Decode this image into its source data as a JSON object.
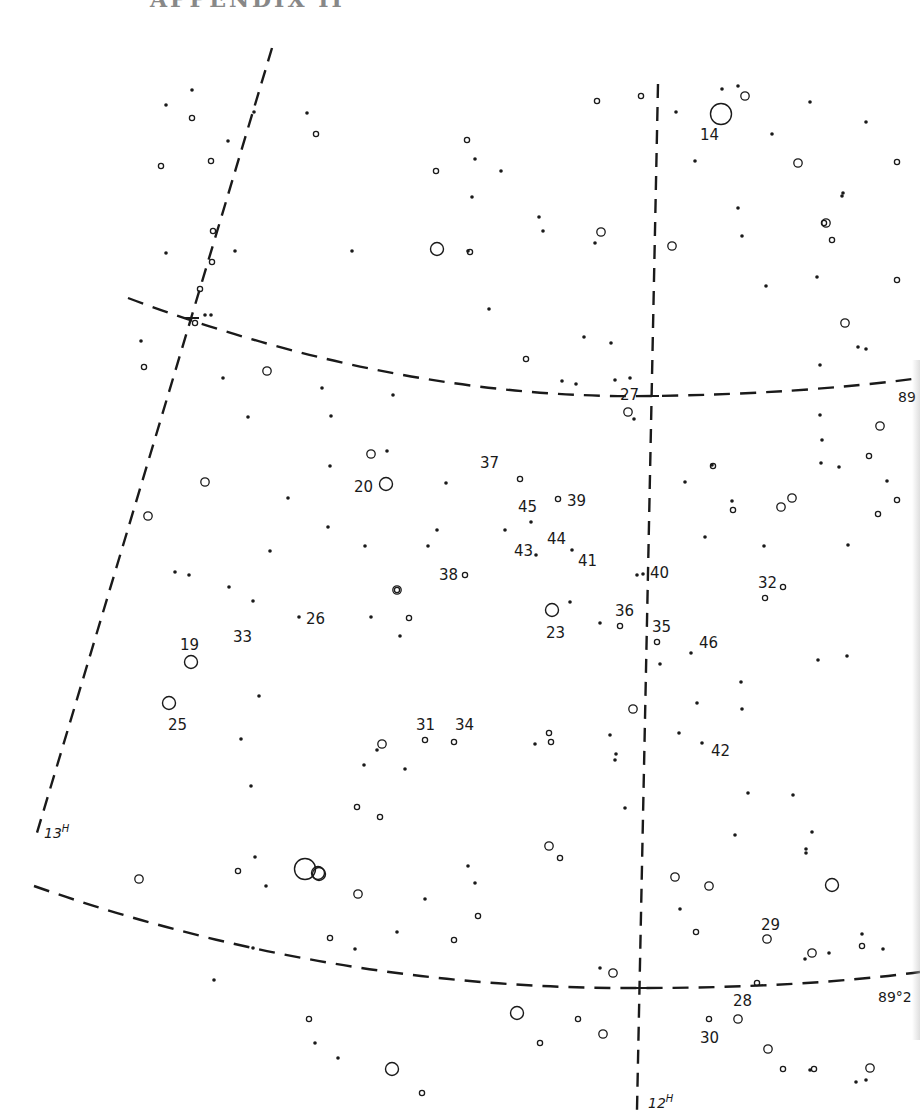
{
  "page": {
    "header": "APPENDIX II"
  },
  "chart": {
    "colors": {
      "ink": "#1a1a1a",
      "paper": "#ffffff"
    },
    "grid": {
      "ra_lines": [
        {
          "label": "13H",
          "label_x": 44,
          "label_y": 838,
          "points": [
            [
              272,
              48
            ],
            [
              36,
              836
            ]
          ]
        },
        {
          "label": "12H",
          "label_x": 648,
          "label_y": 1108,
          "points": [
            [
              658,
              84
            ],
            [
              637,
              1110
            ]
          ]
        }
      ],
      "dec_lines": [
        {
          "label": "89",
          "label_x": 898,
          "label_y": 402,
          "path": "M128 298 Q 400 400 652 396 Q 800 394 920 378"
        },
        {
          "label": "89°2",
          "label_x": 878,
          "label_y": 1002,
          "path": "M34 886 Q 330 990 640 988 Q 800 988 920 972"
        }
      ],
      "intersections": [
        [
          192,
          318
        ],
        [
          652,
          396
        ],
        [
          640,
          988
        ]
      ]
    },
    "labels": [
      {
        "text": "14",
        "x": 700,
        "y": 140
      },
      {
        "text": "27",
        "x": 620,
        "y": 400
      },
      {
        "text": "37",
        "x": 480,
        "y": 468
      },
      {
        "text": "20",
        "x": 354,
        "y": 492
      },
      {
        "text": "45",
        "x": 518,
        "y": 512
      },
      {
        "text": "39",
        "x": 567,
        "y": 506
      },
      {
        "text": "44",
        "x": 547,
        "y": 544
      },
      {
        "text": "43",
        "x": 514,
        "y": 556
      },
      {
        "text": "41",
        "x": 578,
        "y": 566
      },
      {
        "text": "38",
        "x": 439,
        "y": 580
      },
      {
        "text": "40",
        "x": 650,
        "y": 578
      },
      {
        "text": "32",
        "x": 758,
        "y": 588
      },
      {
        "text": "26",
        "x": 306,
        "y": 624
      },
      {
        "text": "33",
        "x": 233,
        "y": 642
      },
      {
        "text": "23",
        "x": 546,
        "y": 638
      },
      {
        "text": "36",
        "x": 615,
        "y": 616
      },
      {
        "text": "35",
        "x": 652,
        "y": 632
      },
      {
        "text": "46",
        "x": 699,
        "y": 648
      },
      {
        "text": "19",
        "x": 180,
        "y": 650
      },
      {
        "text": "25",
        "x": 168,
        "y": 730
      },
      {
        "text": "31",
        "x": 416,
        "y": 730
      },
      {
        "text": "34",
        "x": 455,
        "y": 730
      },
      {
        "text": "42",
        "x": 711,
        "y": 756
      },
      {
        "text": "29",
        "x": 761,
        "y": 930
      },
      {
        "text": "28",
        "x": 733,
        "y": 1006
      },
      {
        "text": "30",
        "x": 700,
        "y": 1043
      }
    ],
    "stars": {
      "dots": [
        [
          192,
          90
        ],
        [
          166,
          105
        ],
        [
          307,
          113
        ],
        [
          254,
          112
        ],
        [
          228,
          141
        ],
        [
          235,
          251
        ],
        [
          166,
          253
        ],
        [
          352,
          251
        ],
        [
          475,
          159
        ],
        [
          501,
          171
        ],
        [
          472,
          197
        ],
        [
          539,
          217
        ],
        [
          543,
          231
        ],
        [
          595,
          243
        ],
        [
          468,
          251
        ],
        [
          489,
          309
        ],
        [
          584,
          337
        ],
        [
          611,
          343
        ],
        [
          676,
          112
        ],
        [
          722,
          89
        ],
        [
          738,
          86
        ],
        [
          810,
          102
        ],
        [
          866,
          122
        ],
        [
          772,
          134
        ],
        [
          738,
          208
        ],
        [
          742,
          236
        ],
        [
          695,
          161
        ],
        [
          842,
          196
        ],
        [
          817,
          277
        ],
        [
          843,
          193
        ],
        [
          766,
          286
        ],
        [
          205,
          315
        ],
        [
          211,
          315
        ],
        [
          141,
          341
        ],
        [
          223,
          378
        ],
        [
          248,
          417
        ],
        [
          322,
          388
        ],
        [
          331,
          416
        ],
        [
          393,
          395
        ],
        [
          330,
          466
        ],
        [
          387,
          451
        ],
        [
          446,
          483
        ],
        [
          328,
          527
        ],
        [
          365,
          546
        ],
        [
          428,
          546
        ],
        [
          437,
          530
        ],
        [
          505,
          530
        ],
        [
          531,
          522
        ],
        [
          536,
          555
        ],
        [
          572,
          550
        ],
        [
          288,
          498
        ],
        [
          270,
          551
        ],
        [
          175,
          572
        ],
        [
          189,
          575
        ],
        [
          229,
          587
        ],
        [
          253,
          601
        ],
        [
          299,
          617
        ],
        [
          371,
          617
        ],
        [
          400,
          636
        ],
        [
          570,
          602
        ],
        [
          600,
          623
        ],
        [
          637,
          575
        ],
        [
          643,
          574
        ],
        [
          660,
          664
        ],
        [
          691,
          653
        ],
        [
          697,
          703
        ],
        [
          702,
          743
        ],
        [
          741,
          682
        ],
        [
          742,
          709
        ],
        [
          818,
          660
        ],
        [
          847,
          656
        ],
        [
          764,
          546
        ],
        [
          848,
          545
        ],
        [
          821,
          463
        ],
        [
          839,
          467
        ],
        [
          887,
          481
        ],
        [
          732,
          501
        ],
        [
          712,
          465
        ],
        [
          685,
          482
        ],
        [
          705,
          537
        ],
        [
          259,
          696
        ],
        [
          241,
          739
        ],
        [
          251,
          786
        ],
        [
          255,
          857
        ],
        [
          266,
          886
        ],
        [
          364,
          765
        ],
        [
          377,
          750
        ],
        [
          405,
          769
        ],
        [
          535,
          744
        ],
        [
          610,
          735
        ],
        [
          616,
          754
        ],
        [
          615,
          760
        ],
        [
          679,
          733
        ],
        [
          625,
          808
        ],
        [
          748,
          793
        ],
        [
          735,
          835
        ],
        [
          793,
          795
        ],
        [
          812,
          832
        ],
        [
          806,
          849
        ],
        [
          806,
          853
        ],
        [
          468,
          866
        ],
        [
          475,
          883
        ],
        [
          425,
          899
        ],
        [
          397,
          932
        ],
        [
          355,
          949
        ],
        [
          253,
          948
        ],
        [
          214,
          980
        ],
        [
          315,
          1043
        ],
        [
          338,
          1058
        ],
        [
          680,
          909
        ],
        [
          805,
          959
        ],
        [
          829,
          953
        ],
        [
          862,
          934
        ],
        [
          883,
          949
        ],
        [
          562,
          381
        ],
        [
          576,
          384
        ],
        [
          615,
          380
        ],
        [
          820,
          365
        ],
        [
          820,
          415
        ],
        [
          866,
          349
        ],
        [
          858,
          347
        ],
        [
          822,
          440
        ],
        [
          600,
          968
        ],
        [
          630,
          378
        ],
        [
          634,
          419
        ],
        [
          866,
          1080
        ],
        [
          856,
          1082
        ],
        [
          810,
          1070
        ]
      ],
      "small_rings": [
        [
          192,
          118
        ],
        [
          161,
          166
        ],
        [
          211,
          161
        ],
        [
          316,
          134
        ],
        [
          436,
          171
        ],
        [
          467,
          140
        ],
        [
          470,
          252
        ],
        [
          597,
          101
        ],
        [
          641,
          96
        ],
        [
          213,
          231
        ],
        [
          212,
          262
        ],
        [
          144,
          367
        ],
        [
          526,
          359
        ],
        [
          200,
          289
        ],
        [
          195,
          323
        ],
        [
          832,
          240
        ],
        [
          897,
          162
        ],
        [
          897,
          280
        ],
        [
          897,
          500
        ],
        [
          824,
          223
        ],
        [
          869,
          456
        ],
        [
          878,
          514
        ],
        [
          713,
          466
        ],
        [
          733,
          510
        ],
        [
          783,
          587
        ],
        [
          765,
          598
        ],
        [
          465,
          575
        ],
        [
          397,
          590
        ],
        [
          409,
          618
        ],
        [
          520,
          479
        ],
        [
          558,
          499
        ],
        [
          620,
          626
        ],
        [
          657,
          642
        ],
        [
          425,
          740
        ],
        [
          454,
          742
        ],
        [
          549,
          733
        ],
        [
          551,
          742
        ],
        [
          357,
          807
        ],
        [
          380,
          817
        ],
        [
          238,
          871
        ],
        [
          478,
          916
        ],
        [
          454,
          940
        ],
        [
          330,
          938
        ],
        [
          560,
          858
        ],
        [
          696,
          932
        ],
        [
          757,
          983
        ],
        [
          862,
          946
        ],
        [
          309,
          1019
        ],
        [
          422,
          1093
        ],
        [
          578,
          1019
        ],
        [
          540,
          1043
        ],
        [
          783,
          1069
        ],
        [
          814,
          1069
        ],
        [
          709,
          1019
        ]
      ],
      "medium_rings": [
        [
          745,
          96
        ],
        [
          798,
          163
        ],
        [
          672,
          246
        ],
        [
          601,
          232
        ],
        [
          826,
          223
        ],
        [
          845,
          323
        ],
        [
          880,
          426
        ],
        [
          267,
          371
        ],
        [
          205,
          482
        ],
        [
          371,
          454
        ],
        [
          148,
          516
        ],
        [
          628,
          412
        ],
        [
          792,
          498
        ],
        [
          781,
          507
        ],
        [
          397,
          590
        ],
        [
          633,
          709
        ],
        [
          382,
          744
        ],
        [
          709,
          886
        ],
        [
          675,
          877
        ],
        [
          549,
          846
        ],
        [
          767,
          939
        ],
        [
          812,
          953
        ],
        [
          738,
          1019
        ],
        [
          768,
          1049
        ],
        [
          603,
          1034
        ],
        [
          870,
          1068
        ],
        [
          613,
          973
        ],
        [
          139,
          879
        ],
        [
          358,
          894
        ]
      ],
      "large_rings": [
        [
          437,
          249
        ],
        [
          386,
          484
        ],
        [
          552,
          610
        ],
        [
          191,
          662
        ],
        [
          169,
          703
        ],
        [
          318,
          873
        ],
        [
          517,
          1013
        ],
        [
          392,
          1069
        ],
        [
          832,
          885
        ]
      ],
      "extra_large_rings": [
        [
          721,
          114
        ],
        [
          305,
          869
        ]
      ]
    }
  }
}
